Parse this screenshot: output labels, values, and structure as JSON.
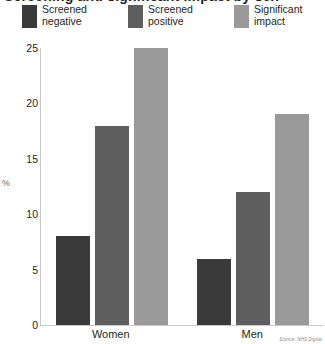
{
  "title": "Screening and significant impact by sex",
  "axis": {
    "ylabel": "%",
    "yticks": [
      "0",
      "5",
      "10",
      "15",
      "20",
      "25"
    ]
  },
  "legend": [
    {
      "label_line1": "Screened",
      "label_line2": "negative",
      "color": "#3a3a3a",
      "swatch_name": "legend-swatch-screened-negative"
    },
    {
      "label_line1": "Screened",
      "label_line2": "positive",
      "color": "#5e5e5e",
      "swatch_name": "legend-swatch-screened-positive"
    },
    {
      "label_line1": "Significant",
      "label_line2": "impact",
      "color": "#9a9a9a",
      "swatch_name": "legend-swatch-significant-impact"
    }
  ],
  "categories": [
    "Women",
    "Men"
  ],
  "source": "Source: NHS Digital",
  "chart_data": {
    "type": "bar",
    "title": "Screening and significant impact by sex",
    "xlabel": "",
    "ylabel": "%",
    "ylim": [
      0,
      25
    ],
    "yticks": [
      0,
      5,
      10,
      15,
      20,
      25
    ],
    "grid": false,
    "legend_position": "top",
    "categories": [
      "Women",
      "Men"
    ],
    "series": [
      {
        "name": "Screened negative",
        "color": "#3a3a3a",
        "values": [
          8,
          6
        ]
      },
      {
        "name": "Screened positive",
        "color": "#5e5e5e",
        "values": [
          18,
          12
        ]
      },
      {
        "name": "Significant impact",
        "color": "#9a9a9a",
        "values": [
          25,
          19
        ]
      }
    ]
  }
}
